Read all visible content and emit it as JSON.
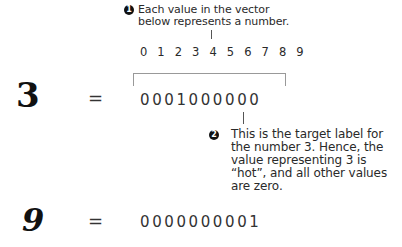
{
  "callout_1": {
    "badge": "1",
    "line_1": "Each value in the vector",
    "line_2": "below represents a number."
  },
  "index_row": {
    "digits": "0 1 2 3 4 5 6 7 8 9"
  },
  "example_3": {
    "digit": "3",
    "equals": "=",
    "vector": "0001000000"
  },
  "callout_2": {
    "badge": "2",
    "line_1": "This is the target label for",
    "line_2": "the number 3. Hence, the",
    "line_3": "value representing 3 is",
    "line_4": "“hot”, and all other values",
    "line_5": "are zero."
  },
  "example_9": {
    "digit": "9",
    "equals": "=",
    "vector": "0000000001"
  }
}
